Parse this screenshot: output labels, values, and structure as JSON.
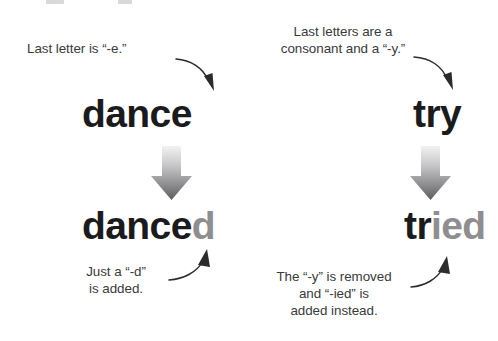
{
  "page": {
    "background_color": "#ffffff",
    "width": 498,
    "height": 341,
    "ink_color": "#1b1b1d",
    "muted_ink_color": "#8e8e90",
    "caption_color": "#3a3a3c"
  },
  "columns": [
    {
      "id": "regular-e-ending",
      "top_caption": "Last letter is “-e.”",
      "base_word": {
        "full": "dance",
        "stem": "dance",
        "suffix": ""
      },
      "result_word": {
        "full": "danced",
        "stem": "dance",
        "suffix": "d"
      },
      "bottom_caption": "Just a “-d”\nis added.",
      "transform_arrow": "down-gradient-arrow"
    },
    {
      "id": "consonant-y-ending",
      "top_caption": "Last letters are a\nconsonant and a “-y.”",
      "base_word": {
        "full": "try",
        "stem": "try",
        "suffix": ""
      },
      "result_word": {
        "full": "tried",
        "stem": "tr",
        "suffix": "ied"
      },
      "bottom_caption": "The “-y” is removed\nand “-ied” is\nadded instead.",
      "transform_arrow": "down-gradient-arrow"
    }
  ],
  "annotations": {
    "pointer_arrows": [
      "curved-arrow-to-dance",
      "curved-arrow-to-try",
      "curved-arrow-to-danced",
      "curved-arrow-to-tried"
    ]
  }
}
